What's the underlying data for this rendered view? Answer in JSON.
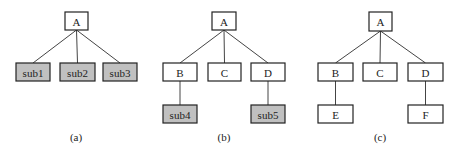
{
  "colors": {
    "plain_fill": "#ffffff",
    "highlight_fill": "#c0c0c0",
    "stroke": "#222222"
  },
  "diagrams": [
    {
      "caption": "(a)",
      "nodes": [
        {
          "id": "A",
          "label": "A",
          "x": 65,
          "y": 12,
          "w": 23,
          "h": 18,
          "highlight": false
        },
        {
          "id": "sub1",
          "label": "sub1",
          "x": 16,
          "y": 63,
          "w": 34,
          "h": 18,
          "highlight": true
        },
        {
          "id": "sub2",
          "label": "sub2",
          "x": 60,
          "y": 63,
          "w": 35,
          "h": 18,
          "highlight": true
        },
        {
          "id": "sub3",
          "label": "sub3",
          "x": 103,
          "y": 63,
          "w": 34,
          "h": 18,
          "highlight": true
        }
      ],
      "edges": [
        [
          "A",
          "sub1"
        ],
        [
          "A",
          "sub2"
        ],
        [
          "A",
          "sub3"
        ]
      ],
      "caption_pos": {
        "x": 76,
        "y": 141
      }
    },
    {
      "caption": "(b)",
      "nodes": [
        {
          "id": "A",
          "label": "A",
          "x": 212,
          "y": 12,
          "w": 24,
          "h": 18,
          "highlight": false
        },
        {
          "id": "B",
          "label": "B",
          "x": 163,
          "y": 63,
          "w": 34,
          "h": 18,
          "highlight": false
        },
        {
          "id": "C",
          "label": "C",
          "x": 208,
          "y": 63,
          "w": 33,
          "h": 18,
          "highlight": false
        },
        {
          "id": "D",
          "label": "D",
          "x": 251,
          "y": 63,
          "w": 34,
          "h": 18,
          "highlight": false
        },
        {
          "id": "sub4",
          "label": "sub4",
          "x": 163,
          "y": 105,
          "w": 34,
          "h": 18,
          "highlight": true
        },
        {
          "id": "sub5",
          "label": "sub5",
          "x": 251,
          "y": 105,
          "w": 34,
          "h": 18,
          "highlight": true
        }
      ],
      "edges": [
        [
          "A",
          "B"
        ],
        [
          "A",
          "C"
        ],
        [
          "A",
          "D"
        ],
        [
          "B",
          "sub4"
        ],
        [
          "D",
          "sub5"
        ]
      ],
      "caption_pos": {
        "x": 224,
        "y": 141
      }
    },
    {
      "caption": "(c)",
      "nodes": [
        {
          "id": "A",
          "label": "A",
          "x": 369,
          "y": 12,
          "w": 23,
          "h": 19,
          "highlight": false
        },
        {
          "id": "B",
          "label": "B",
          "x": 318,
          "y": 63,
          "w": 35,
          "h": 18,
          "highlight": false
        },
        {
          "id": "C",
          "label": "C",
          "x": 363,
          "y": 63,
          "w": 34,
          "h": 18,
          "highlight": false
        },
        {
          "id": "D",
          "label": "D",
          "x": 408,
          "y": 63,
          "w": 35,
          "h": 18,
          "highlight": false
        },
        {
          "id": "E",
          "label": "E",
          "x": 318,
          "y": 105,
          "w": 35,
          "h": 18,
          "highlight": false
        },
        {
          "id": "F",
          "label": "F",
          "x": 408,
          "y": 105,
          "w": 35,
          "h": 18,
          "highlight": false
        }
      ],
      "edges": [
        [
          "A",
          "B"
        ],
        [
          "A",
          "C"
        ],
        [
          "A",
          "D"
        ],
        [
          "B",
          "E"
        ],
        [
          "D",
          "F"
        ]
      ],
      "caption_pos": {
        "x": 380,
        "y": 141
      }
    }
  ]
}
